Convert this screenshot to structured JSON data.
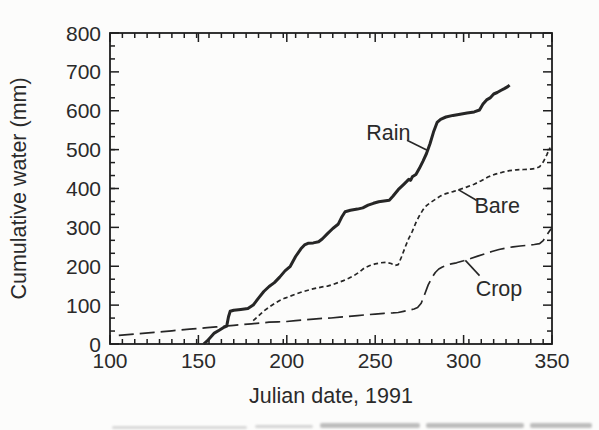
{
  "figure": {
    "background": "#fcfcfb",
    "ink": "#262626",
    "frame_color": "#1e1e1e",
    "text_color": "#2a2a2a"
  },
  "chart_data": {
    "type": "line",
    "title": "",
    "xlabel": "Julian date, 1991",
    "ylabel": "Cumulative water (mm)",
    "xlim": [
      100,
      350
    ],
    "ylim": [
      0,
      800
    ],
    "x_major_ticks": [
      100,
      150,
      200,
      250,
      300,
      350
    ],
    "y_major_ticks": [
      0,
      100,
      200,
      300,
      400,
      500,
      600,
      700,
      800
    ],
    "x_minor_step_days": 7,
    "y_minor_ticks_between_majors": 2,
    "grid": false,
    "legend_position": "inline-annotations",
    "layout": {
      "left": 110,
      "top": 33,
      "right": 552,
      "bottom": 344,
      "tick_major_len": 9,
      "tick_minor_len": 5,
      "x_tick_label_offset": 24,
      "x_title_baseline_y": 403,
      "y_title_center_x": 26
    },
    "series": [
      {
        "name": "Rain",
        "style": "solid",
        "stroke_width": 3,
        "dash": "",
        "points": [
          [
            153,
            0
          ],
          [
            155,
            8
          ],
          [
            157,
            18
          ],
          [
            159,
            28
          ],
          [
            162,
            36
          ],
          [
            164,
            42
          ],
          [
            166,
            46
          ],
          [
            167,
            70
          ],
          [
            168,
            84
          ],
          [
            170,
            87
          ],
          [
            174,
            89
          ],
          [
            178,
            91
          ],
          [
            181,
            100
          ],
          [
            184,
            118
          ],
          [
            187,
            135
          ],
          [
            190,
            148
          ],
          [
            193,
            158
          ],
          [
            196,
            172
          ],
          [
            199,
            188
          ],
          [
            202,
            200
          ],
          [
            205,
            225
          ],
          [
            208,
            245
          ],
          [
            210,
            255
          ],
          [
            212,
            259
          ],
          [
            215,
            260
          ],
          [
            218,
            263
          ],
          [
            220,
            270
          ],
          [
            223,
            284
          ],
          [
            226,
            297
          ],
          [
            229,
            308
          ],
          [
            231,
            326
          ],
          [
            233,
            340
          ],
          [
            236,
            344
          ],
          [
            240,
            347
          ],
          [
            243,
            350
          ],
          [
            246,
            357
          ],
          [
            249,
            362
          ],
          [
            252,
            366
          ],
          [
            255,
            368
          ],
          [
            258,
            370
          ],
          [
            260,
            380
          ],
          [
            263,
            397
          ],
          [
            266,
            410
          ],
          [
            268,
            419
          ],
          [
            269,
            424
          ],
          [
            270,
            421
          ],
          [
            271,
            430
          ],
          [
            273,
            436
          ],
          [
            275,
            452
          ],
          [
            277,
            470
          ],
          [
            279,
            490
          ],
          [
            281,
            515
          ],
          [
            283,
            545
          ],
          [
            285,
            570
          ],
          [
            287,
            578
          ],
          [
            290,
            584
          ],
          [
            294,
            588
          ],
          [
            298,
            591
          ],
          [
            302,
            594
          ],
          [
            306,
            597
          ],
          [
            309,
            602
          ],
          [
            311,
            617
          ],
          [
            313,
            628
          ],
          [
            315,
            633
          ],
          [
            317,
            643
          ],
          [
            319,
            647
          ],
          [
            321,
            652
          ],
          [
            323,
            657
          ],
          [
            325,
            662
          ],
          [
            326,
            666
          ]
        ]
      },
      {
        "name": "Bare",
        "style": "short-dash",
        "stroke_width": 1.7,
        "dash": "4.5,3",
        "points": [
          [
            181,
            60
          ],
          [
            184,
            72
          ],
          [
            187,
            85
          ],
          [
            190,
            95
          ],
          [
            193,
            104
          ],
          [
            196,
            112
          ],
          [
            199,
            118
          ],
          [
            202,
            123
          ],
          [
            205,
            128
          ],
          [
            208,
            133
          ],
          [
            211,
            137
          ],
          [
            214,
            141
          ],
          [
            217,
            144
          ],
          [
            220,
            147
          ],
          [
            223,
            149
          ],
          [
            226,
            153
          ],
          [
            229,
            158
          ],
          [
            232,
            163
          ],
          [
            235,
            169
          ],
          [
            238,
            176
          ],
          [
            241,
            185
          ],
          [
            244,
            196
          ],
          [
            247,
            202
          ],
          [
            250,
            206
          ],
          [
            253,
            209
          ],
          [
            256,
            210
          ],
          [
            259,
            207
          ],
          [
            261,
            202
          ],
          [
            263,
            204
          ],
          [
            265,
            225
          ],
          [
            267,
            250
          ],
          [
            269,
            272
          ],
          [
            271,
            290
          ],
          [
            273,
            312
          ],
          [
            275,
            330
          ],
          [
            277,
            345
          ],
          [
            279,
            356
          ],
          [
            281,
            363
          ],
          [
            284,
            372
          ],
          [
            287,
            381
          ],
          [
            290,
            387
          ],
          [
            294,
            392
          ],
          [
            298,
            398
          ],
          [
            302,
            404
          ],
          [
            306,
            411
          ],
          [
            310,
            420
          ],
          [
            314,
            430
          ],
          [
            318,
            437
          ],
          [
            322,
            442
          ],
          [
            326,
            446
          ],
          [
            330,
            448
          ],
          [
            334,
            449
          ],
          [
            338,
            450
          ],
          [
            341,
            452
          ],
          [
            343,
            456
          ],
          [
            345,
            468
          ],
          [
            347,
            486
          ],
          [
            348,
            497
          ],
          [
            349,
            505
          ]
        ]
      },
      {
        "name": "Crop",
        "style": "long-dash",
        "stroke_width": 1.7,
        "dash": "15,6",
        "points": [
          [
            105,
            22
          ],
          [
            110,
            24
          ],
          [
            115,
            26
          ],
          [
            120,
            28
          ],
          [
            125,
            30
          ],
          [
            130,
            32
          ],
          [
            135,
            34
          ],
          [
            140,
            36
          ],
          [
            145,
            38
          ],
          [
            150,
            40
          ],
          [
            155,
            42
          ],
          [
            160,
            44
          ],
          [
            165,
            46
          ],
          [
            170,
            48
          ],
          [
            175,
            50
          ],
          [
            180,
            52
          ],
          [
            185,
            54
          ],
          [
            190,
            56
          ],
          [
            195,
            57
          ],
          [
            200,
            58
          ],
          [
            205,
            60
          ],
          [
            210,
            62
          ],
          [
            215,
            64
          ],
          [
            220,
            66
          ],
          [
            225,
            67
          ],
          [
            230,
            69
          ],
          [
            235,
            71
          ],
          [
            240,
            73
          ],
          [
            245,
            75
          ],
          [
            250,
            77
          ],
          [
            255,
            79
          ],
          [
            260,
            80
          ],
          [
            263,
            81
          ],
          [
            266,
            84
          ],
          [
            269,
            87
          ],
          [
            272,
            90
          ],
          [
            274,
            94
          ],
          [
            276,
            105
          ],
          [
            278,
            128
          ],
          [
            280,
            152
          ],
          [
            282,
            170
          ],
          [
            284,
            184
          ],
          [
            286,
            193
          ],
          [
            288,
            198
          ],
          [
            290,
            202
          ],
          [
            293,
            206
          ],
          [
            296,
            209
          ],
          [
            300,
            214
          ],
          [
            304,
            220
          ],
          [
            308,
            226
          ],
          [
            312,
            232
          ],
          [
            316,
            238
          ],
          [
            320,
            243
          ],
          [
            324,
            247
          ],
          [
            328,
            250
          ],
          [
            332,
            252
          ],
          [
            336,
            254
          ],
          [
            340,
            256
          ],
          [
            343,
            258
          ],
          [
            345,
            266
          ],
          [
            347,
            280
          ],
          [
            349,
            293
          ],
          [
            350,
            298
          ]
        ]
      }
    ],
    "annotations": [
      {
        "series": "Rain",
        "text": "Rain",
        "x": 257.5,
        "y": 545,
        "leader": {
          "x1": 268,
          "y1": 524,
          "x2": 280,
          "y2": 497
        }
      },
      {
        "series": "Bare",
        "text": "Bare",
        "x": 319,
        "y": 355,
        "leader": {
          "x1": 307.5,
          "y1": 369,
          "x2": 297,
          "y2": 397
        }
      },
      {
        "series": "Crop",
        "text": "Crop",
        "x": 320,
        "y": 142,
        "leader": {
          "x1": 301,
          "y1": 215,
          "x2": 309,
          "y2": 176
        }
      }
    ]
  },
  "artifacts": {
    "caption_remnants": [
      {
        "x": 112,
        "y": 426,
        "w": 135,
        "h": 2.5,
        "color": "#c9c9c9",
        "opacity": 0.7
      },
      {
        "x": 255,
        "y": 425,
        "w": 58,
        "h": 3,
        "color": "#c4c4c4",
        "opacity": 0.7
      },
      {
        "x": 320,
        "y": 423,
        "w": 100,
        "h": 4.5,
        "color": "#a9a9a9",
        "opacity": 0.75
      },
      {
        "x": 426,
        "y": 423,
        "w": 98,
        "h": 4.5,
        "color": "#a9a9a9",
        "opacity": 0.75
      },
      {
        "x": 530,
        "y": 423,
        "w": 62,
        "h": 4.5,
        "color": "#a9a9a9",
        "opacity": 0.75
      }
    ]
  }
}
